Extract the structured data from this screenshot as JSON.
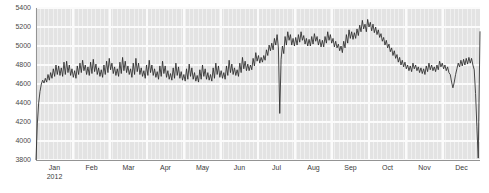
{
  "chart_data": {
    "type": "line",
    "title": "",
    "subtitle": "",
    "xlabel": "",
    "ylabel": "",
    "ylim": [
      3800,
      5400
    ],
    "ytick_labels": [
      "5400",
      "5200",
      "5000",
      "4800",
      "4600",
      "4400",
      "4200",
      "4000",
      "3800"
    ],
    "ytick_values": [
      5400,
      5200,
      5000,
      4800,
      4600,
      4400,
      4200,
      4000,
      3800
    ],
    "xtick_labels": [
      "Jan",
      "Feb",
      "Mar",
      "Apr",
      "May",
      "Jun",
      "Jul",
      "Aug",
      "Sep",
      "Oct",
      "Nov",
      "Dec"
    ],
    "x_origin_label": "2012",
    "grid": true,
    "legend": "none",
    "series_name": "value",
    "line_color": "#2b2b2b",
    "plot_background": "#e3e3e3",
    "gridline_color": "#f5f5f5",
    "x_start_fraction": 0.0,
    "x_end_fraction": 1.0,
    "x": [
      0.0,
      0.003,
      0.006,
      0.009,
      0.012,
      0.015,
      0.018,
      0.021,
      0.024,
      0.027,
      0.03,
      0.033,
      0.036,
      0.039,
      0.042,
      0.045,
      0.048,
      0.051,
      0.054,
      0.057,
      0.06,
      0.063,
      0.066,
      0.069,
      0.072,
      0.075,
      0.078,
      0.081,
      0.084,
      0.087,
      0.09,
      0.093,
      0.096,
      0.099,
      0.102,
      0.105,
      0.108,
      0.111,
      0.114,
      0.117,
      0.12,
      0.123,
      0.126,
      0.129,
      0.132,
      0.135,
      0.138,
      0.141,
      0.144,
      0.147,
      0.15,
      0.153,
      0.156,
      0.159,
      0.162,
      0.165,
      0.168,
      0.171,
      0.174,
      0.177,
      0.18,
      0.183,
      0.186,
      0.189,
      0.192,
      0.195,
      0.198,
      0.201,
      0.204,
      0.207,
      0.21,
      0.213,
      0.216,
      0.219,
      0.222,
      0.225,
      0.228,
      0.231,
      0.234,
      0.237,
      0.24,
      0.243,
      0.246,
      0.249,
      0.252,
      0.255,
      0.258,
      0.261,
      0.264,
      0.267,
      0.27,
      0.273,
      0.276,
      0.279,
      0.282,
      0.285,
      0.288,
      0.291,
      0.294,
      0.297,
      0.3,
      0.303,
      0.306,
      0.309,
      0.312,
      0.315,
      0.318,
      0.321,
      0.324,
      0.327,
      0.33,
      0.333,
      0.336,
      0.339,
      0.342,
      0.345,
      0.348,
      0.351,
      0.354,
      0.357,
      0.36,
      0.363,
      0.366,
      0.369,
      0.372,
      0.375,
      0.378,
      0.381,
      0.384,
      0.387,
      0.39,
      0.393,
      0.396,
      0.399,
      0.402,
      0.405,
      0.408,
      0.411,
      0.414,
      0.417,
      0.42,
      0.423,
      0.426,
      0.429,
      0.432,
      0.435,
      0.438,
      0.441,
      0.444,
      0.447,
      0.45,
      0.453,
      0.456,
      0.459,
      0.462,
      0.465,
      0.468,
      0.471,
      0.474,
      0.477,
      0.48,
      0.483,
      0.486,
      0.489,
      0.492,
      0.495,
      0.498,
      0.501,
      0.504,
      0.507,
      0.51,
      0.513,
      0.516,
      0.519,
      0.522,
      0.525,
      0.528,
      0.531,
      0.534,
      0.537,
      0.54,
      0.543,
      0.546,
      0.549,
      0.552,
      0.555,
      0.558,
      0.561,
      0.564,
      0.567,
      0.57,
      0.573,
      0.576,
      0.579,
      0.582,
      0.585,
      0.588,
      0.591,
      0.594,
      0.597,
      0.6,
      0.603,
      0.606,
      0.609,
      0.612,
      0.615,
      0.618,
      0.621,
      0.624,
      0.627,
      0.63,
      0.633,
      0.636,
      0.639,
      0.642,
      0.645,
      0.648,
      0.651,
      0.654,
      0.657,
      0.66,
      0.663,
      0.666,
      0.669,
      0.672,
      0.675,
      0.678,
      0.681,
      0.684,
      0.687,
      0.69,
      0.693,
      0.696,
      0.699,
      0.702,
      0.705,
      0.708,
      0.711,
      0.714,
      0.717,
      0.72,
      0.723,
      0.726,
      0.729,
      0.732,
      0.735,
      0.738,
      0.741,
      0.744,
      0.747,
      0.75,
      0.753,
      0.756,
      0.759,
      0.762,
      0.765,
      0.768,
      0.771,
      0.774,
      0.777,
      0.78,
      0.783,
      0.786,
      0.789,
      0.792,
      0.795,
      0.798,
      0.801,
      0.804,
      0.807,
      0.81,
      0.813,
      0.816,
      0.819,
      0.822,
      0.825,
      0.828,
      0.831,
      0.834,
      0.837,
      0.84,
      0.843,
      0.846,
      0.849,
      0.852,
      0.855,
      0.858,
      0.861,
      0.864,
      0.867,
      0.87,
      0.873,
      0.876,
      0.879,
      0.882,
      0.885,
      0.888,
      0.891,
      0.894,
      0.897,
      0.9,
      0.903,
      0.906,
      0.909,
      0.912,
      0.915,
      0.918,
      0.921,
      0.924,
      0.927,
      0.93,
      0.933,
      0.936,
      0.939,
      0.942,
      0.945,
      0.948,
      0.951,
      0.954,
      0.957,
      0.96,
      0.963,
      0.966,
      0.969,
      0.972,
      0.975,
      0.978,
      0.981,
      0.984,
      0.987,
      0.99,
      0.993,
      0.996,
      1.0
    ],
    "values": [
      3805,
      4180,
      4400,
      4520,
      4600,
      4640,
      4610,
      4660,
      4620,
      4700,
      4640,
      4720,
      4660,
      4760,
      4680,
      4800,
      4700,
      4790,
      4690,
      4770,
      4680,
      4830,
      4700,
      4840,
      4720,
      4800,
      4690,
      4760,
      4670,
      4740,
      4660,
      4790,
      4700,
      4820,
      4720,
      4850,
      4740,
      4800,
      4700,
      4780,
      4690,
      4830,
      4710,
      4860,
      4730,
      4810,
      4700,
      4770,
      4680,
      4750,
      4670,
      4800,
      4700,
      4840,
      4720,
      4870,
      4750,
      4820,
      4710,
      4780,
      4690,
      4760,
      4680,
      4830,
      4710,
      4880,
      4740,
      4840,
      4720,
      4790,
      4700,
      4760,
      4670,
      4820,
      4700,
      4870,
      4730,
      4820,
      4700,
      4770,
      4680,
      4740,
      4660,
      4800,
      4690,
      4850,
      4720,
      4800,
      4690,
      4760,
      4670,
      4730,
      4650,
      4790,
      4680,
      4840,
      4710,
      4790,
      4670,
      4740,
      4650,
      4710,
      4640,
      4770,
      4660,
      4820,
      4690,
      4780,
      4660,
      4730,
      4640,
      4700,
      4630,
      4760,
      4650,
      4810,
      4680,
      4770,
      4650,
      4720,
      4630,
      4690,
      4620,
      4750,
      4650,
      4800,
      4680,
      4760,
      4650,
      4720,
      4640,
      4700,
      4630,
      4770,
      4660,
      4820,
      4700,
      4790,
      4670,
      4740,
      4660,
      4720,
      4650,
      4790,
      4690,
      4850,
      4720,
      4810,
      4700,
      4770,
      4690,
      4750,
      4680,
      4820,
      4720,
      4880,
      4760,
      4840,
      4740,
      4810,
      4740,
      4800,
      4750,
      4870,
      4790,
      4930,
      4840,
      4900,
      4820,
      4880,
      4830,
      4900,
      4850,
      4960,
      4900,
      5010,
      4950,
      5030,
      4960,
      5080,
      5010,
      5120,
      4980,
      4290,
      4860,
      5000,
      4920,
      5100,
      5010,
      5150,
      5060,
      5120,
      5010,
      5080,
      5000,
      5090,
      5010,
      5120,
      5040,
      5150,
      5060,
      5110,
      5020,
      5080,
      5000,
      5070,
      5000,
      5100,
      5020,
      5130,
      5050,
      5100,
      5010,
      5070,
      4990,
      5060,
      4990,
      5100,
      5030,
      5150,
      5060,
      5120,
      5030,
      5080,
      4990,
      5050,
      4980,
      5020,
      4950,
      5000,
      4930,
      5050,
      4980,
      5120,
      5030,
      5170,
      5080,
      5150,
      5070,
      5140,
      5080,
      5180,
      5110,
      5220,
      5150,
      5270,
      5180,
      5230,
      5150,
      5280,
      5200,
      5250,
      5160,
      5230,
      5140,
      5200,
      5120,
      5170,
      5090,
      5130,
      5050,
      5090,
      5010,
      5060,
      4980,
      5020,
      4940,
      4980,
      4900,
      4950,
      4870,
      4910,
      4830,
      4880,
      4800,
      4850,
      4780,
      4830,
      4760,
      4800,
      4740,
      4790,
      4730,
      4820,
      4760,
      4800,
      4740,
      4780,
      4720,
      4770,
      4710,
      4760,
      4700,
      4790,
      4730,
      4820,
      4750,
      4800,
      4740,
      4780,
      4730,
      4800,
      4750,
      4840,
      4780,
      4820,
      4760,
      4800,
      4740,
      4780,
      4720,
      4700,
      4620,
      4560,
      4620,
      4700,
      4760,
      4820,
      4780,
      4850,
      4790,
      4860,
      4800,
      4870,
      4810,
      4880,
      4820,
      4870,
      4800,
      4750,
      4500,
      4150,
      3820,
      5150
    ]
  },
  "axis": {
    "y_title": "",
    "x_title": ""
  }
}
